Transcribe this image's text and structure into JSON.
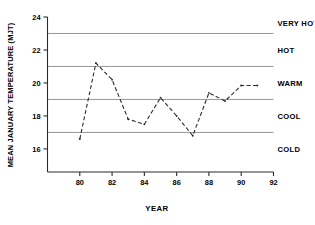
{
  "chart_data": {
    "type": "line",
    "title": "",
    "xlabel": "YEAR",
    "ylabel": "MEAN JANUARY TEMPERATURE (MJT)",
    "xlim": [
      78,
      92
    ],
    "ylim": [
      14.6,
      24
    ],
    "xticks": [
      "80",
      "82",
      "84",
      "86",
      "88",
      "90",
      "92"
    ],
    "xtick_values": [
      80,
      82,
      84,
      86,
      88,
      90,
      92
    ],
    "yticks": [
      "16",
      "18",
      "20",
      "22",
      "24"
    ],
    "ytick_values": [
      16,
      18,
      20,
      22,
      24
    ],
    "grid": "horizontal",
    "gridline_values": [
      17,
      19,
      21,
      23
    ],
    "legend": "none",
    "line_style": "dashed",
    "x": [
      80,
      81,
      82,
      83,
      84,
      85,
      86,
      87,
      88,
      89,
      90,
      91
    ],
    "values": [
      16.6,
      21.2,
      20.2,
      17.8,
      17.5,
      19.1,
      18.0,
      16.8,
      19.4,
      18.9,
      19.85,
      19.85
    ],
    "series": [
      {
        "name": "Mean January Temperature",
        "values": [
          16.6,
          21.2,
          20.2,
          17.8,
          17.5,
          19.1,
          18.0,
          16.8,
          19.4,
          18.9,
          19.85,
          19.85
        ]
      }
    ],
    "bands": [
      {
        "label": "VERY HOT",
        "min": 23,
        "max": 24,
        "label_y": 23.6
      },
      {
        "label": "HOT",
        "min": 21,
        "max": 23,
        "label_y": 22.0
      },
      {
        "label": "WARM",
        "min": 19,
        "max": 21,
        "label_y": 20.0
      },
      {
        "label": "COOL",
        "min": 17,
        "max": 19,
        "label_y": 18.0
      },
      {
        "label": "COLD",
        "min": 15,
        "max": 17,
        "label_y": 16.0
      }
    ],
    "colors": {
      "axis": "#2b2b2b",
      "gridline": "#8a8a8a",
      "series": "#2b2b2b",
      "background": "#ffffff",
      "text": "#000000"
    }
  }
}
